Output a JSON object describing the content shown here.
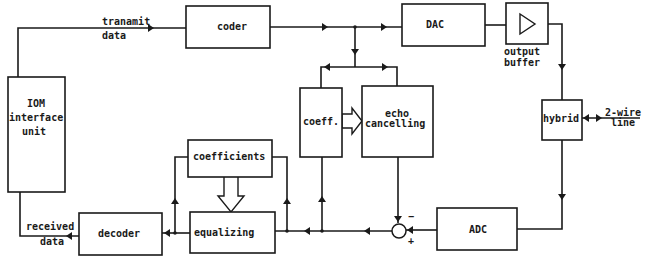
{
  "diagram": {
    "type": "block-diagram",
    "blocks": {
      "iom": {
        "lines": [
          "IOM",
          "interface",
          "unit"
        ]
      },
      "coder": {
        "label": "coder"
      },
      "dac": {
        "label": "DAC"
      },
      "output_buffer": {
        "label": "output buffer",
        "lines": [
          "output",
          "buffer"
        ],
        "symbol": "triangle-amplifier"
      },
      "hybrid": {
        "label": "hybrid"
      },
      "adc": {
        "label": "ADC"
      },
      "coeff": {
        "label": "coeff."
      },
      "echo": {
        "lines": [
          "echo",
          "cancelling"
        ]
      },
      "coefficients": {
        "label": "coefficients"
      },
      "equalizing": {
        "label": "equalizing"
      },
      "decoder": {
        "label": "decoder"
      }
    },
    "signals": {
      "transmit": {
        "lines": [
          "tranamit",
          "data"
        ]
      },
      "received": {
        "lines": [
          "received",
          "data"
        ]
      },
      "line": {
        "lines": [
          "2-wire",
          "line"
        ]
      }
    },
    "summer": {
      "minus": "−",
      "plus": "+"
    }
  }
}
